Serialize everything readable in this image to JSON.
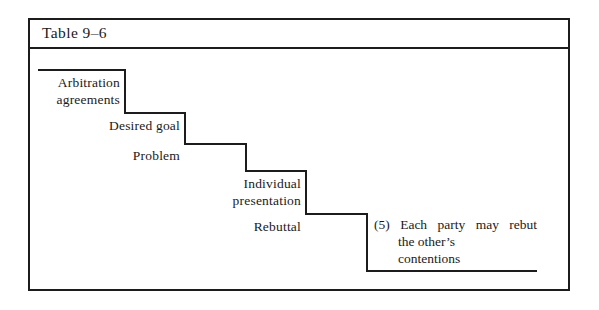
{
  "figure": {
    "caption": "Table 9–6",
    "steps": [
      {
        "id": "arbitration-agreements",
        "label": "Arbitration\nagreements"
      },
      {
        "id": "desired-goal",
        "label": "Desired  goal"
      },
      {
        "id": "problem",
        "label": "Problem"
      },
      {
        "id": "individual-presentation",
        "label": "Individual\npresentation"
      },
      {
        "id": "rebuttal",
        "label": "Rebuttal"
      }
    ],
    "note": {
      "marker": "(5)",
      "line1": "Each  party  may  rebut",
      "line2": "the  other’s",
      "line3": "contentions"
    },
    "colors": {
      "ink": "#1c1c1c",
      "paper": "#ffffff"
    }
  }
}
